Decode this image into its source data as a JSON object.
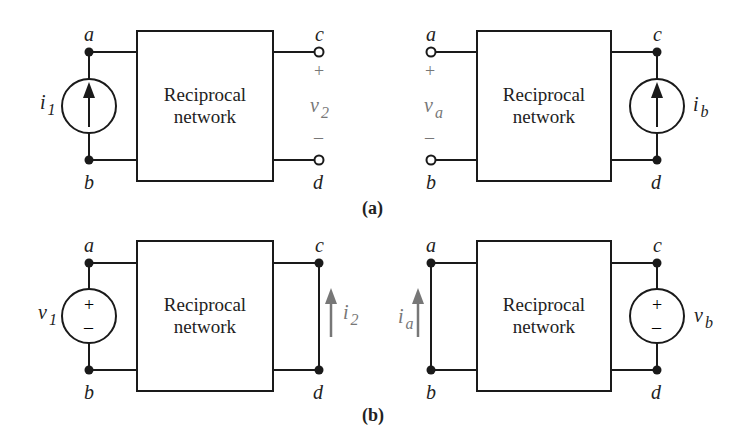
{
  "figure": {
    "part_a": {
      "caption": "(a)",
      "left_circuit": {
        "box_label_line1": "Reciprocal",
        "box_label_line2": "network",
        "nodes": {
          "top_left": "a",
          "bottom_left": "b",
          "top_right": "c",
          "bottom_right": "d"
        },
        "source": {
          "type": "current-source",
          "symbol": "i",
          "subscript": "1"
        },
        "output": {
          "type": "open-circuit-voltage",
          "symbol": "v",
          "subscript": "2",
          "plus": "+",
          "minus": "–"
        }
      },
      "right_circuit": {
        "box_label_line1": "Reciprocal",
        "box_label_line2": "network",
        "nodes": {
          "top_left": "a",
          "bottom_left": "b",
          "top_right": "c",
          "bottom_right": "d"
        },
        "source": {
          "type": "current-source",
          "symbol": "i",
          "subscript": "b"
        },
        "output": {
          "type": "open-circuit-voltage",
          "symbol": "v",
          "subscript": "a",
          "plus": "+",
          "minus": "–"
        }
      }
    },
    "part_b": {
      "caption": "(b)",
      "left_circuit": {
        "box_label_line1": "Reciprocal",
        "box_label_line2": "network",
        "nodes": {
          "top_left": "a",
          "bottom_left": "b",
          "top_right": "c",
          "bottom_right": "d"
        },
        "source": {
          "type": "voltage-source",
          "symbol": "v",
          "subscript": "1",
          "plus": "+",
          "minus": "–"
        },
        "output": {
          "type": "short-circuit-current",
          "symbol": "i",
          "subscript": "2"
        }
      },
      "right_circuit": {
        "box_label_line1": "Reciprocal",
        "box_label_line2": "network",
        "nodes": {
          "top_left": "a",
          "bottom_left": "b",
          "top_right": "c",
          "bottom_right": "d"
        },
        "source": {
          "type": "voltage-source",
          "symbol": "v",
          "subscript": "b",
          "plus": "+",
          "minus": "–"
        },
        "output": {
          "type": "short-circuit-current",
          "symbol": "i",
          "subscript": "a"
        }
      }
    },
    "colors": {
      "line": "#1a1a1a",
      "highlight": "#777777"
    }
  }
}
